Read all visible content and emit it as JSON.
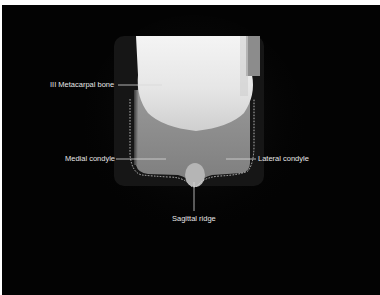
{
  "figure": {
    "labels": {
      "metacarpal": "III Metacarpal bone",
      "medial": "Medial condyle",
      "lateral": "Lateral condyle",
      "sagittal": "Sagittal ridge"
    },
    "colors": {
      "background": "#030303",
      "bone_bright": "#f2f2f2",
      "label_text": "#e6e6e6",
      "leader_line": "#d9d9d9",
      "border": "#ffffff"
    }
  }
}
